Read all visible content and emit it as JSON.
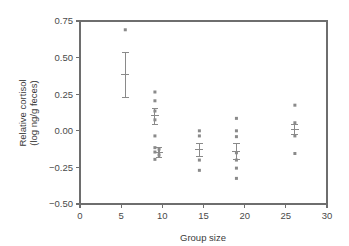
{
  "chart_data": {
    "type": "scatter",
    "title": "",
    "xlabel": "Group size",
    "ylabel_line1": "Relative cortisol",
    "ylabel_line2": "(log ng/g feces)",
    "xlim": [
      0,
      30
    ],
    "ylim": [
      -0.5,
      0.75
    ],
    "xticks": [
      0,
      5,
      10,
      15,
      20,
      25,
      30
    ],
    "xtick_labels": [
      "0",
      "5",
      "10",
      "15",
      "20",
      "25",
      "30"
    ],
    "yticks": [
      -0.5,
      -0.25,
      0.0,
      0.25,
      0.5,
      0.75
    ],
    "ytick_labels": [
      "−0.50",
      "−0.25",
      "0.00",
      "0.25",
      "0.50",
      "0.75"
    ],
    "grid": false,
    "legend": "none",
    "marker": "small-square",
    "groups": [
      {
        "name": "group-5",
        "x": 5.5,
        "points": [
          0.69
        ],
        "mean": 0.385,
        "error_low": 0.225,
        "error_high": 0.535
      },
      {
        "name": "group-9",
        "x": 9.1,
        "points": [
          0.265,
          0.205,
          0.135,
          0.075,
          -0.035,
          -0.115,
          -0.145,
          -0.195
        ],
        "mean": 0.105,
        "error_low": 0.04,
        "error_high": 0.15
      },
      {
        "name": "group-9b",
        "x": 9.6,
        "points": [
          -0.125,
          -0.165
        ],
        "mean": -0.15,
        "error_low": -0.18,
        "error_high": -0.115
      },
      {
        "name": "group-14",
        "x": 14.5,
        "points": [
          0.0,
          -0.035,
          -0.2,
          -0.27
        ],
        "mean": -0.13,
        "error_low": -0.175,
        "error_high": -0.085
      },
      {
        "name": "group-19",
        "x": 19.0,
        "points": [
          0.085,
          0.0,
          -0.04,
          -0.15,
          -0.2,
          -0.255,
          -0.325
        ],
        "mean": -0.14,
        "error_low": -0.195,
        "error_high": -0.085
      },
      {
        "name": "group-26",
        "x": 26.1,
        "points": [
          0.175,
          0.055,
          -0.035,
          -0.155
        ],
        "mean": 0.01,
        "error_low": -0.025,
        "error_high": 0.045
      }
    ]
  },
  "figure": {
    "plot_left_px": 80,
    "plot_right_px": 327,
    "plot_top_px": 21,
    "plot_bottom_px": 204,
    "axis_color": "#6e6e6e",
    "marker_color": "#8a8a8a",
    "text_color": "#3a3a3a",
    "background": "#ffffff"
  }
}
